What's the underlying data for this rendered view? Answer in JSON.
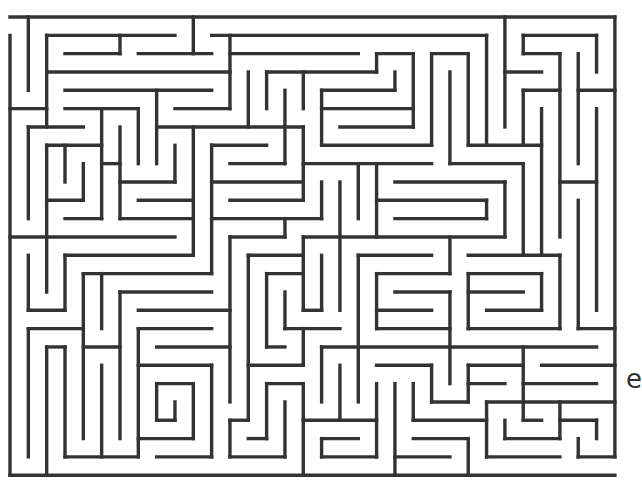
{
  "maze": {
    "origin": [
      10,
      17
    ],
    "cell": 18.33,
    "cols": 33,
    "rows": 25,
    "wall_color": "#333333",
    "background": "#ffffff",
    "entrance": {
      "side": "left",
      "row": 0
    },
    "exit": {
      "side": "right",
      "row": 24
    },
    "horizontal_walls": [
      [
        0,
        0,
        33
      ],
      [
        1,
        2,
        9
      ],
      [
        1,
        11,
        26
      ],
      [
        1,
        28,
        32
      ],
      [
        2,
        3,
        6
      ],
      [
        2,
        7,
        11
      ],
      [
        2,
        12,
        19
      ],
      [
        2,
        20,
        22
      ],
      [
        2,
        23,
        25
      ],
      [
        2,
        28,
        30
      ],
      [
        3,
        2,
        12
      ],
      [
        3,
        14,
        20
      ],
      [
        3,
        27,
        29
      ],
      [
        4,
        3,
        11
      ],
      [
        4,
        17,
        21
      ],
      [
        4,
        28,
        30
      ],
      [
        4,
        31,
        33
      ],
      [
        5,
        0,
        2
      ],
      [
        5,
        3,
        7
      ],
      [
        5,
        9,
        12
      ],
      [
        5,
        17,
        22
      ],
      [
        6,
        1,
        4
      ],
      [
        6,
        8,
        16
      ],
      [
        6,
        18,
        22
      ],
      [
        7,
        2,
        5
      ],
      [
        7,
        11,
        14
      ],
      [
        7,
        17,
        23
      ],
      [
        7,
        25,
        29
      ],
      [
        8,
        5,
        6
      ],
      [
        8,
        12,
        15
      ],
      [
        8,
        16,
        23
      ],
      [
        8,
        24,
        28
      ],
      [
        9,
        6,
        9
      ],
      [
        9,
        11,
        16
      ],
      [
        9,
        21,
        27
      ],
      [
        9,
        30,
        32
      ],
      [
        10,
        2,
        4
      ],
      [
        10,
        7,
        10
      ],
      [
        10,
        12,
        16
      ],
      [
        10,
        20,
        26
      ],
      [
        11,
        3,
        5
      ],
      [
        11,
        6,
        10
      ],
      [
        11,
        11,
        17
      ],
      [
        11,
        21,
        26
      ],
      [
        12,
        0,
        9
      ],
      [
        12,
        12,
        15
      ],
      [
        12,
        16,
        27
      ],
      [
        13,
        3,
        10
      ],
      [
        13,
        13,
        16
      ],
      [
        13,
        19,
        23
      ],
      [
        13,
        25,
        30
      ],
      [
        14,
        4,
        11
      ],
      [
        14,
        14,
        16
      ],
      [
        14,
        20,
        24
      ],
      [
        14,
        25,
        29
      ],
      [
        15,
        6,
        11
      ],
      [
        15,
        21,
        24
      ],
      [
        15,
        25,
        28
      ],
      [
        16,
        1,
        3
      ],
      [
        16,
        7,
        12
      ],
      [
        16,
        16,
        17
      ],
      [
        16,
        20,
        23
      ],
      [
        16,
        26,
        29
      ],
      [
        17,
        1,
        4
      ],
      [
        17,
        7,
        11
      ],
      [
        17,
        15,
        18
      ],
      [
        17,
        20,
        24
      ],
      [
        17,
        25,
        30
      ],
      [
        17,
        31,
        33
      ],
      [
        18,
        2,
        3
      ],
      [
        18,
        4,
        6
      ],
      [
        18,
        8,
        12
      ],
      [
        18,
        14,
        15
      ],
      [
        18,
        17,
        32
      ],
      [
        19,
        7,
        11
      ],
      [
        19,
        13,
        16
      ],
      [
        19,
        20,
        23
      ],
      [
        19,
        25,
        28
      ],
      [
        19,
        29,
        33
      ],
      [
        20,
        8,
        10
      ],
      [
        20,
        14,
        16
      ],
      [
        20,
        25,
        27
      ],
      [
        20,
        28,
        32
      ],
      [
        21,
        23,
        25
      ],
      [
        21,
        26,
        33
      ],
      [
        22,
        8,
        9
      ],
      [
        22,
        12,
        13
      ],
      [
        22,
        16,
        20
      ],
      [
        22,
        22,
        26
      ],
      [
        22,
        28,
        29
      ],
      [
        22,
        30,
        32
      ],
      [
        23,
        7,
        10
      ],
      [
        23,
        13,
        14
      ],
      [
        23,
        17,
        19
      ],
      [
        23,
        22,
        25
      ],
      [
        23,
        27,
        30
      ],
      [
        24,
        3,
        7
      ],
      [
        24,
        8,
        11
      ],
      [
        24,
        12,
        15
      ],
      [
        24,
        17,
        20
      ],
      [
        24,
        21,
        24
      ],
      [
        24,
        26,
        30
      ],
      [
        24,
        31,
        33
      ],
      [
        25,
        0,
        33
      ]
    ],
    "vertical_walls": [
      [
        0,
        1,
        25
      ],
      [
        1,
        0,
        4
      ],
      [
        1,
        6,
        11
      ],
      [
        1,
        13,
        16
      ],
      [
        1,
        17,
        24
      ],
      [
        2,
        1,
        6
      ],
      [
        2,
        7,
        15
      ],
      [
        2,
        18,
        25
      ],
      [
        3,
        7,
        9
      ],
      [
        3,
        13,
        16
      ],
      [
        3,
        18,
        24
      ],
      [
        4,
        8,
        10
      ],
      [
        4,
        14,
        23
      ],
      [
        5,
        5,
        11
      ],
      [
        5,
        14,
        17
      ],
      [
        5,
        19,
        24
      ],
      [
        6,
        1,
        2
      ],
      [
        6,
        6,
        11
      ],
      [
        6,
        15,
        23
      ],
      [
        7,
        5,
        8
      ],
      [
        7,
        17,
        24
      ],
      [
        8,
        4,
        8
      ],
      [
        8,
        20,
        22
      ],
      [
        9,
        7,
        9
      ],
      [
        9,
        21,
        22
      ],
      [
        10,
        0,
        2
      ],
      [
        10,
        6,
        13
      ],
      [
        10,
        20,
        23
      ],
      [
        11,
        7,
        14
      ],
      [
        11,
        19,
        24
      ],
      [
        12,
        1,
        5
      ],
      [
        12,
        12,
        21
      ],
      [
        12,
        22,
        24
      ],
      [
        13,
        3,
        6
      ],
      [
        13,
        13,
        22
      ],
      [
        14,
        3,
        5
      ],
      [
        14,
        14,
        18
      ],
      [
        14,
        20,
        23
      ],
      [
        15,
        4,
        8
      ],
      [
        15,
        11,
        12
      ],
      [
        15,
        15,
        17
      ],
      [
        15,
        21,
        24
      ],
      [
        16,
        3,
        5
      ],
      [
        16,
        6,
        10
      ],
      [
        16,
        12,
        16
      ],
      [
        16,
        17,
        19
      ],
      [
        16,
        20,
        25
      ],
      [
        17,
        4,
        7
      ],
      [
        17,
        9,
        11
      ],
      [
        17,
        13,
        16
      ],
      [
        17,
        18,
        21
      ],
      [
        17,
        23,
        24
      ],
      [
        18,
        9,
        16
      ],
      [
        18,
        19,
        22
      ],
      [
        19,
        8,
        11
      ],
      [
        19,
        13,
        21
      ],
      [
        20,
        2,
        3
      ],
      [
        20,
        8,
        12
      ],
      [
        20,
        14,
        17
      ],
      [
        20,
        20,
        24
      ],
      [
        21,
        3,
        4
      ],
      [
        21,
        20,
        25
      ],
      [
        22,
        2,
        6
      ],
      [
        22,
        20,
        22
      ],
      [
        23,
        2,
        7
      ],
      [
        23,
        19,
        21
      ],
      [
        24,
        3,
        8
      ],
      [
        24,
        12,
        14
      ],
      [
        24,
        15,
        20
      ],
      [
        25,
        2,
        7
      ],
      [
        25,
        14,
        17
      ],
      [
        25,
        19,
        21
      ],
      [
        25,
        23,
        25
      ],
      [
        26,
        1,
        7
      ],
      [
        26,
        10,
        11
      ],
      [
        26,
        21,
        24
      ],
      [
        27,
        0,
        6
      ],
      [
        27,
        9,
        12
      ],
      [
        27,
        22,
        23
      ],
      [
        28,
        1,
        2
      ],
      [
        28,
        4,
        7
      ],
      [
        28,
        8,
        13
      ],
      [
        28,
        18,
        22
      ],
      [
        29,
        5,
        13
      ],
      [
        29,
        14,
        16
      ],
      [
        30,
        2,
        12
      ],
      [
        30,
        13,
        17
      ],
      [
        30,
        21,
        23
      ],
      [
        31,
        2,
        8
      ],
      [
        31,
        10,
        17
      ],
      [
        31,
        23,
        24
      ],
      [
        32,
        1,
        3
      ],
      [
        32,
        5,
        16
      ],
      [
        32,
        22,
        23
      ],
      [
        33,
        0,
        24
      ]
    ]
  },
  "edge_glyph": {
    "text": "e"
  }
}
